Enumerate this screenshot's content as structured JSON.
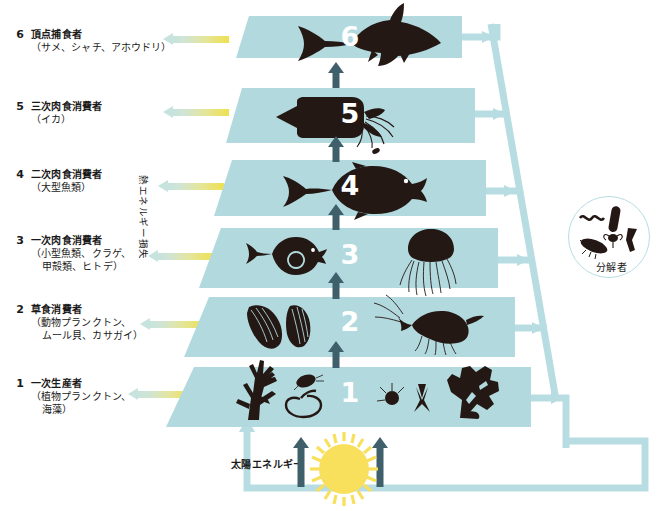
{
  "diagram": {
    "title_caption": "熱エネルギー損失",
    "solar_label": "太陽エネルギー",
    "decomposer_label": "分解者",
    "band_color": "#b2d9dd",
    "pipe_color": "#b7dde2",
    "flow_arrow_color": "#3f5f6b",
    "sun_color": "#f8df5c",
    "heat_arrow_gradient_from": "#efe04f",
    "heat_arrow_gradient_to": "#c6e3dd"
  },
  "levels": [
    {
      "number": "6",
      "title": "頂点捕食者",
      "sub": "（サメ、シャチ、アホウドリ）",
      "organisms": [
        "shark"
      ]
    },
    {
      "number": "5",
      "title": "三次肉食消費者",
      "sub": "（イカ）",
      "organisms": [
        "squid"
      ]
    },
    {
      "number": "4",
      "title": "二次肉食消費者",
      "sub": "（大型魚類）",
      "organisms": [
        "large-fish"
      ]
    },
    {
      "number": "3",
      "title": "一次肉食消費者",
      "sub": "（小型魚類、クラゲ、",
      "sub2": "甲殻類、ヒトデ）",
      "organisms": [
        "small-fish",
        "jellyfish"
      ]
    },
    {
      "number": "2",
      "title": "草食消費者",
      "sub": "（動物プランクトン、",
      "sub2": "ムール貝、カサガイ）",
      "organisms": [
        "mussels",
        "shrimp"
      ]
    },
    {
      "number": "1",
      "title": "一次生産者",
      "sub": "（植物プランクトン、",
      "sub2": "海藻）",
      "organisms": [
        "coral-algae",
        "copepod",
        "diatom-chain",
        "phytoplankton",
        "dinoflagellate",
        "seaweed"
      ]
    }
  ]
}
